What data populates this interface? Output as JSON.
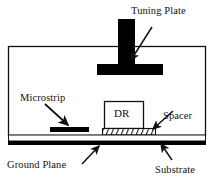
{
  "figure": {
    "type": "cross-section-schematic",
    "background": "#ffffff",
    "stroke_color": "#111111",
    "fill_black": "#000000"
  },
  "labels": {
    "tuning_plate": "Tuning Plate",
    "microstrip": "Microstrip",
    "dr": "DR",
    "spacer": "Spacer",
    "ground_plane": "Ground Plane",
    "substrate": "Substrate"
  },
  "parts": {
    "enclosure": {
      "name": "enclosure-box",
      "x": 8,
      "y": 46,
      "width": 198,
      "height": 90
    },
    "tuning_post": {
      "name": "tuning-plate-post",
      "x": 118,
      "y": 19,
      "width": 17,
      "height": 46
    },
    "tuning_plate_bar": {
      "name": "tuning-plate-bar",
      "x": 97,
      "y": 64,
      "width": 66,
      "height": 11
    },
    "microstrip_bar": {
      "name": "microstrip-bar",
      "x": 50,
      "y": 127,
      "width": 39,
      "height": 5
    },
    "dr_block": {
      "name": "dr-block",
      "x": 104,
      "y": 101,
      "width": 40,
      "height": 27
    },
    "spacer_hatch": {
      "name": "spacer-hatch",
      "x": 102,
      "y": 128,
      "width": 54,
      "height": 7
    },
    "substrate_layer": {
      "name": "substrate-layer",
      "x": 8,
      "y": 135,
      "width": 198,
      "height": 6
    },
    "ground_plane_layer": {
      "name": "ground-plane-layer",
      "x": 8,
      "y": 141,
      "width": 198,
      "height": 4
    }
  },
  "leaders": [
    {
      "name": "tuning-plate-leader",
      "from": [
        150,
        28
      ],
      "to": [
        130,
        60
      ]
    },
    {
      "name": "microstrip-leader",
      "from": [
        46,
        104
      ],
      "to": [
        68,
        126
      ]
    },
    {
      "name": "spacer-leader",
      "from": [
        172,
        112
      ],
      "to": [
        152,
        130
      ]
    },
    {
      "name": "ground-plane-leader",
      "from": [
        80,
        165
      ],
      "to": [
        98,
        146
      ]
    },
    {
      "name": "substrate-leader",
      "from": [
        172,
        160
      ],
      "to": [
        160,
        143
      ]
    }
  ]
}
